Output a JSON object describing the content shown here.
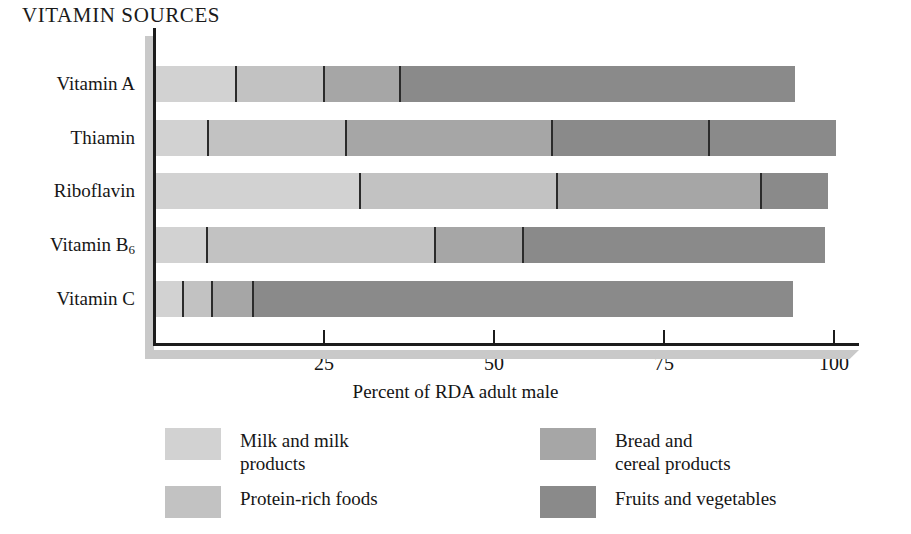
{
  "chart_data": {
    "type": "bar",
    "orientation": "horizontal",
    "stacked": true,
    "title": "VITAMIN SOURCES",
    "xlabel": "Percent of RDA adult male",
    "ylabel": "",
    "xlim": [
      0,
      104
    ],
    "grid": false,
    "legend_position": "bottom",
    "tick_values": [
      25,
      50,
      75,
      100
    ],
    "tick_labels": [
      "25",
      "50",
      "75",
      "100"
    ],
    "categories": [
      "Vitamin A",
      "Thiamin",
      "Riboflavin",
      "Vitamin B₆",
      "Vitamin C"
    ],
    "series": [
      {
        "name": "Milk and milk products",
        "color": "#d2d2d2",
        "values": [
          11.8,
          7.6,
          30.0,
          7.5,
          4.0
        ]
      },
      {
        "name": "Protein-rich foods",
        "color": "#c2c2c2",
        "values": [
          12.9,
          20.4,
          29.0,
          33.5,
          4.3
        ]
      },
      {
        "name": "Bread and cereal products",
        "color": "#a6a6a6",
        "values": [
          11.2,
          30.2,
          30.0,
          13.0,
          6.0
        ]
      },
      {
        "name": "Fruits and vegetables",
        "color": "#8a8a8a",
        "values": [
          58.1,
          41.8,
          9.8,
          44.4,
          79.4
        ]
      }
    ],
    "bar_totals": [
      94.0,
      100.0,
      98.8,
      98.4,
      93.7
    ],
    "annotations": [
      {
        "category": "Thiamin",
        "type": "internal-divider",
        "value": 81.3
      }
    ]
  },
  "legend": {
    "items": [
      {
        "label": "Milk and milk\nproducts",
        "color": "#d2d2d2"
      },
      {
        "label": "Protein-rich foods",
        "color": "#c2c2c2"
      },
      {
        "label": "Bread and\ncereal products",
        "color": "#a6a6a6"
      },
      {
        "label": "Fruits and vegetables",
        "color": "#8a8a8a"
      }
    ]
  },
  "axis": {
    "origin_label": "",
    "x_title": "Percent of RDA adult male"
  }
}
